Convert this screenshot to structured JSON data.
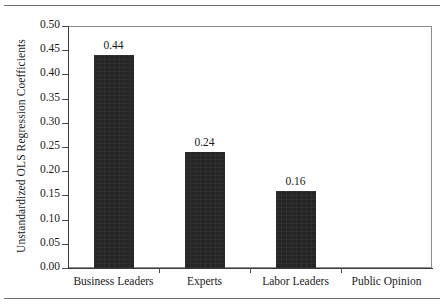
{
  "chart_data": {
    "type": "bar",
    "title": "",
    "subtitle": "",
    "xlabel": "",
    "ylabel": "Unstandardized OLS Regression Coefficients",
    "categories": [
      "Business Leaders",
      "Experts",
      "Labor Leaders",
      "Public Opinion"
    ],
    "values": [
      0.44,
      0.24,
      0.16,
      0.0
    ],
    "value_labels": [
      "0.44",
      "0.24",
      "0.16",
      ""
    ],
    "ylim": [
      0.0,
      0.5
    ],
    "ytick_step": 0.05,
    "ytick_labels": [
      "0.00",
      "0.05",
      "0.10",
      "0.15",
      "0.20",
      "0.25",
      "0.30",
      "0.35",
      "0.40",
      "0.45",
      "0.50"
    ],
    "ytick_values": [
      0.0,
      0.05,
      0.1,
      0.15,
      0.2,
      0.25,
      0.3,
      0.35,
      0.4,
      0.45,
      0.5
    ],
    "grid": false,
    "legend": "none",
    "bar_color": "#262626",
    "frame_color": "#8d8d8d",
    "axis_color": "#3a3a3a",
    "rule_color": "#6b6b6b"
  }
}
